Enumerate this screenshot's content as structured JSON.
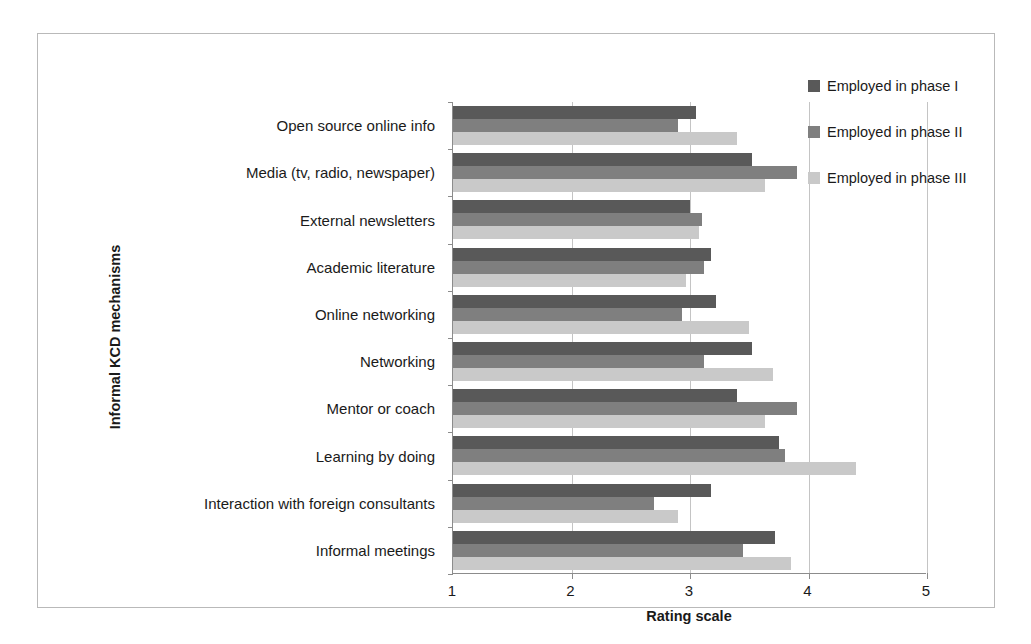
{
  "chart_data": {
    "type": "bar",
    "orientation": "horizontal",
    "title": "",
    "xlabel": "Rating scale",
    "ylabel": "Informal KCD mechanisms",
    "xlim": [
      1,
      5
    ],
    "xticks": [
      1,
      2,
      3,
      4,
      5
    ],
    "xticklabels": [
      "1",
      "2",
      "3",
      "4",
      "5"
    ],
    "grid": true,
    "grid_axis": "x",
    "legend_position": "top-right",
    "categories": [
      "Open source online info",
      "Media (tv, radio, newspaper)",
      "External newsletters",
      "Academic literature",
      "Online networking",
      "Networking",
      "Mentor or coach",
      "Learning by doing",
      "Interaction with foreign consultants",
      "Informal meetings"
    ],
    "series": [
      {
        "name": "Employed in phase I",
        "color": "#595959",
        "values": [
          3.05,
          3.52,
          3.0,
          3.18,
          3.22,
          3.52,
          3.4,
          3.75,
          3.18,
          3.72
        ]
      },
      {
        "name": "Employed in phase II",
        "color": "#7f7f7f",
        "values": [
          2.9,
          3.9,
          3.1,
          3.12,
          2.93,
          3.12,
          3.9,
          3.8,
          2.7,
          3.45
        ]
      },
      {
        "name": "Employed in phase III",
        "color": "#c9c9c9",
        "values": [
          3.4,
          3.63,
          3.08,
          2.97,
          3.5,
          3.7,
          3.63,
          4.4,
          2.9,
          3.85
        ]
      }
    ]
  },
  "legend": {
    "items": [
      {
        "label": "Employed in phase I",
        "color": "#595959"
      },
      {
        "label": "Employed in phase II",
        "color": "#7f7f7f"
      },
      {
        "label": "Employed in phase III",
        "color": "#c9c9c9"
      }
    ]
  },
  "axes": {
    "x_title": "Rating scale",
    "y_title": "Informal KCD mechanisms"
  }
}
